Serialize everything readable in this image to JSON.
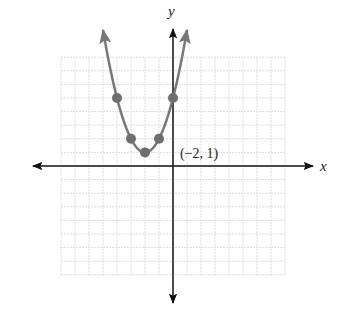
{
  "chart_data": {
    "type": "line",
    "title": "",
    "xlabel": "x",
    "ylabel": "y",
    "function": "y = (x + 2)^2 + 1",
    "xlim": [
      -8,
      8
    ],
    "ylim": [
      -8,
      8
    ],
    "grid": true,
    "legend": null,
    "series": [
      {
        "name": "parabola",
        "color": "#777777",
        "points": [
          {
            "x": -4,
            "y": 5
          },
          {
            "x": -3,
            "y": 2
          },
          {
            "x": -2,
            "y": 1
          },
          {
            "x": -1,
            "y": 2
          },
          {
            "x": 0,
            "y": 5
          }
        ],
        "arrows_at_ends": true
      }
    ],
    "annotations": [
      {
        "text": "(−2, 1)",
        "x": -2,
        "y": 1,
        "note": "vertex"
      }
    ]
  },
  "labels": {
    "x_axis": "x",
    "y_axis": "y",
    "vertex": "(−2, 1)"
  },
  "colors": {
    "grid": "#dcdcdc",
    "axis": "#111111",
    "curve": "#777777",
    "point": "#6e6e6e"
  }
}
